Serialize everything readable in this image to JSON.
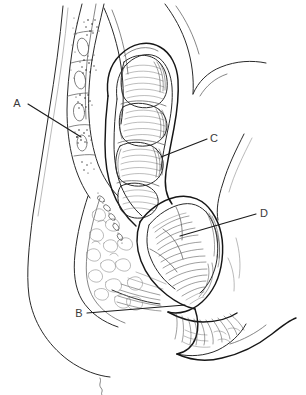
{
  "figure": {
    "type": "anatomical-line-drawing",
    "style": "pen-and-ink medical illustration",
    "background_color": "#ffffff",
    "ink_color": "#1b1b1b",
    "label_color": "#3a3a3a",
    "width": 306,
    "height": 395
  },
  "labels": [
    {
      "id": "A",
      "text": "A",
      "x": 17,
      "y": 107,
      "leader_from": [
        28,
        104
      ],
      "leader_to": [
        81,
        137
      ],
      "target": "sacrum-vertebral-bone"
    },
    {
      "id": "B",
      "text": "B",
      "x": 76,
      "y": 317,
      "leader_from": [
        87,
        313
      ],
      "leader_to": [
        185,
        305
      ],
      "target": "anal-canal-sphincter"
    },
    {
      "id": "C",
      "text": "C",
      "x": 212,
      "y": 142,
      "leader_from": [
        207,
        139
      ],
      "leader_to": [
        161,
        157
      ],
      "target": "rectal-wall"
    },
    {
      "id": "D",
      "text": "D",
      "x": 262,
      "y": 217,
      "leader_from": [
        256,
        214
      ],
      "leader_to": [
        180,
        236
      ],
      "target": "lower-rectum-ampulla"
    }
  ],
  "regions": [
    {
      "name": "sacrum-vertebrae",
      "description": "stippled vertebral bodies with oval intervertebral discs, upper left"
    },
    {
      "name": "rectum",
      "description": "segmented haustrated rectal lumen with transverse folds, center"
    },
    {
      "name": "ampulla",
      "description": "lower dilated rectal segment with dense hatching, center right"
    },
    {
      "name": "anal-canal",
      "description": "narrow terminal canal with radiating hatch lines, bottom center"
    },
    {
      "name": "perineal-soft-tissue",
      "description": "lobulated cloud-textured tissue, left of rectum"
    },
    {
      "name": "body-contour-anterior",
      "description": "long smooth curve forming abdominal wall, far left"
    },
    {
      "name": "buttock-contour",
      "description": "smooth curve at right and bottom right"
    },
    {
      "name": "pubic-hair-squiggle",
      "description": "small wavy line at bottom center"
    }
  ]
}
